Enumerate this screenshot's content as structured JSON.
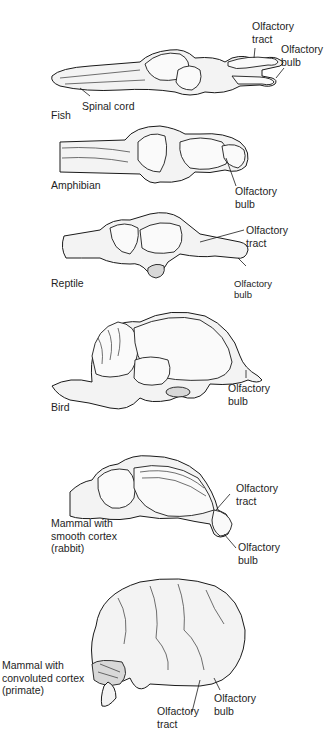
{
  "figure": {
    "panels": [
      {
        "id": "fish",
        "name": "Fish",
        "labels": [
          "Olfactory\ntract",
          "Olfactory\nbulb",
          "Spinal cord"
        ]
      },
      {
        "id": "amphibian",
        "name": "Amphibian",
        "labels": [
          "Olfactory\nbulb"
        ]
      },
      {
        "id": "reptile",
        "name": "Reptile",
        "labels": [
          "Olfactory\ntract",
          "Olfactory\nbulb"
        ]
      },
      {
        "id": "bird",
        "name": "Bird",
        "labels": [
          "Olfactory\nbulb"
        ]
      },
      {
        "id": "rabbit",
        "name": "Mammal with\nsmooth cortex\n(rabbit)",
        "labels": [
          "Olfactory\ntract",
          "Olfactory\nbulb"
        ]
      },
      {
        "id": "primate",
        "name": "Mammal with\nconvoluted cortex\n(primate)",
        "labels": [
          "Olfactory\ntract",
          "Olfactory\nbulb"
        ]
      }
    ]
  }
}
